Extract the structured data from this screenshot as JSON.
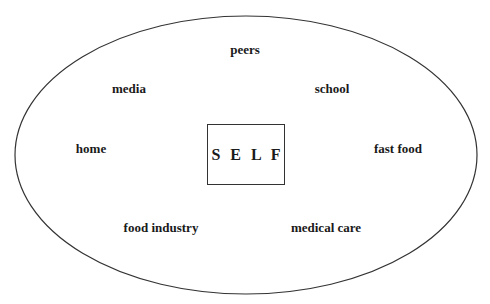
{
  "diagram": {
    "center": {
      "label": "S E L F"
    },
    "influences": [
      {
        "id": "peers",
        "label": "peers",
        "x": 245,
        "y": 50
      },
      {
        "id": "media",
        "label": "media",
        "x": 129,
        "y": 89
      },
      {
        "id": "school",
        "label": "school",
        "x": 332,
        "y": 89
      },
      {
        "id": "home",
        "label": "home",
        "x": 91,
        "y": 149
      },
      {
        "id": "fast-food",
        "label": "fast food",
        "x": 398,
        "y": 149
      },
      {
        "id": "food-industry",
        "label": "food industry",
        "x": 161,
        "y": 228
      },
      {
        "id": "medical-care",
        "label": "medical care",
        "x": 326,
        "y": 228
      }
    ],
    "ellipse": {
      "cx": 246,
      "cy": 155,
      "rx": 231,
      "ry": 139,
      "stroke": "#333333"
    }
  }
}
